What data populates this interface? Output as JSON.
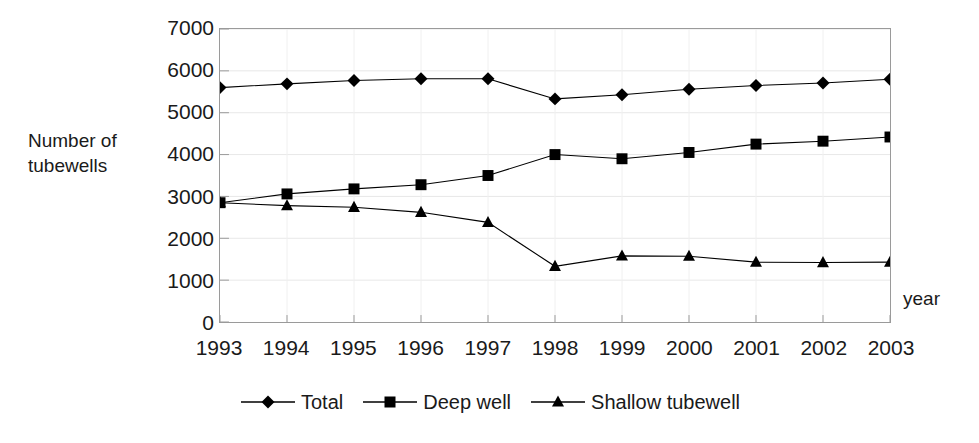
{
  "chart_data": {
    "type": "line",
    "title": "",
    "xlabel": "year",
    "ylabel": "Number of\ntubewells",
    "x": [
      1993,
      1994,
      1995,
      1996,
      1997,
      1998,
      1999,
      2000,
      2001,
      2002,
      2003
    ],
    "categories": [
      "1993",
      "1994",
      "1995",
      "1996",
      "1997",
      "1998",
      "1999",
      "2000",
      "2001",
      "2002",
      "2003"
    ],
    "ylim": [
      0,
      7000
    ],
    "yticks": [
      0,
      1000,
      2000,
      3000,
      4000,
      5000,
      6000,
      7000
    ],
    "ytick_labels": [
      "0",
      "1000",
      "2000",
      "3000",
      "4000",
      "5000",
      "6000",
      "7000"
    ],
    "grid": true,
    "legend_position": "bottom",
    "series": [
      {
        "name": "Total",
        "marker": "diamond",
        "color": "#000000",
        "values": [
          5600,
          5690,
          5770,
          5810,
          5810,
          5330,
          5430,
          5560,
          5650,
          5710,
          5800
        ]
      },
      {
        "name": "Deep well",
        "marker": "square",
        "color": "#000000",
        "values": [
          2850,
          3060,
          3180,
          3280,
          3500,
          4000,
          3900,
          4050,
          4250,
          4320,
          4420
        ]
      },
      {
        "name": "Shallow tubewell",
        "marker": "triangle",
        "color": "#000000",
        "values": [
          2850,
          2780,
          2740,
          2620,
          2380,
          1330,
          1580,
          1570,
          1430,
          1420,
          1430
        ]
      }
    ]
  },
  "axes": {
    "y_title_line1": "Number of",
    "y_title_line2": "tubewells",
    "y_title": "Number of\ntubewells",
    "x_title": "year"
  },
  "legend": {
    "items": [
      {
        "label": "Total",
        "marker": "diamond"
      },
      {
        "label": "Deep well",
        "marker": "square"
      },
      {
        "label": "Shallow tubewell",
        "marker": "triangle"
      }
    ]
  },
  "style": {
    "line_color": "#000000",
    "marker_color": "#000000",
    "axis_color": "#9a9a9a",
    "grid_color": "#e8e8e8",
    "text_color": "#1a1a1a",
    "background": "#ffffff"
  }
}
